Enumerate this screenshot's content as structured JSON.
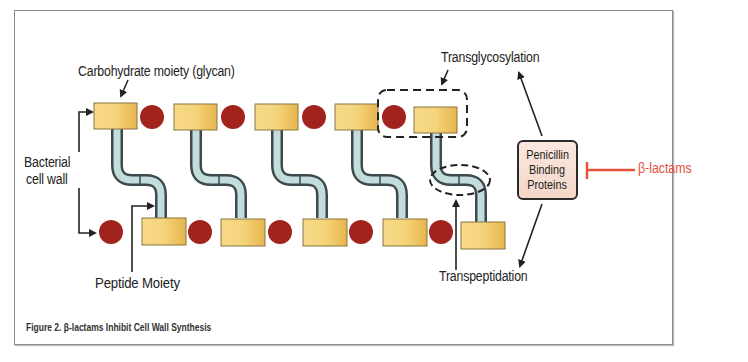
{
  "figure": {
    "caption": "Figure 2. β-lactams Inhibit Cell Wall Synthesis"
  },
  "labels": {
    "carbohydrate": "Carbohydrate moiety (glycan)",
    "bacterial_line1": "Bacterial",
    "bacterial_line2": "cell wall",
    "peptide": "Peptide  Moiety",
    "transglycosylation": "Transglycosylation",
    "transpeptidation": "Transpeptidation",
    "pbp_line1": "Penicillin",
    "pbp_line2": "Binding",
    "pbp_line3": "Proteins",
    "blactams": "β-lactams"
  },
  "colors": {
    "glycan_fill": "#f2c96a",
    "peptide_circle": "#a2231d",
    "tube_fill": "#c3dcdc",
    "tube_border": "#3d4a4d",
    "inhibitor": "#e8503a",
    "pbp_fill": "#f7ddd0"
  },
  "diagram": {
    "top_row_glycans": 5,
    "bottom_row_glycans": 5,
    "top_row_peptides": 4,
    "bottom_row_peptides": 5,
    "cross_links": 5
  }
}
